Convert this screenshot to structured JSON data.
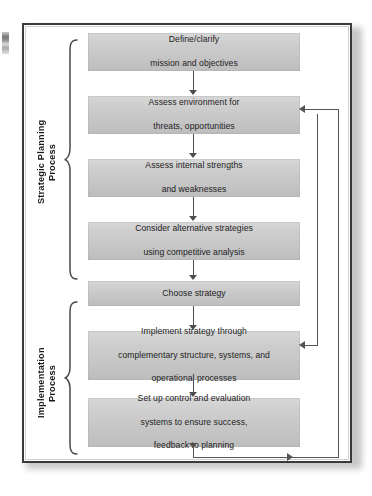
{
  "figure": {
    "type": "process-flow-diagram",
    "title_visible": false,
    "margin_fragment": "",
    "box_fill": "#cdcdcd",
    "frame_color": "#3a3a3a",
    "line_color": "#555555"
  },
  "groups": [
    {
      "id": "strategic-planning",
      "label": "Strategic Planning\nProcess",
      "label_line1": "Strategic Planning",
      "label_line2": "Process",
      "covers_steps": [
        1,
        2,
        3,
        4,
        5
      ]
    },
    {
      "id": "implementation",
      "label": "Implementation\nProcess",
      "label_line1": "Implementation",
      "label_line2": "Process",
      "covers_steps": [
        6,
        7
      ]
    }
  ],
  "steps": [
    {
      "n": 1,
      "id": "define-mission",
      "lines": [
        "Define/clarify",
        "mission and objectives"
      ]
    },
    {
      "n": 2,
      "id": "assess-environment",
      "lines": [
        "Assess environment for",
        "threats, opportunities"
      ]
    },
    {
      "n": 3,
      "id": "assess-internal",
      "lines": [
        "Assess internal strengths",
        "and weaknesses"
      ]
    },
    {
      "n": 4,
      "id": "consider-alternatives",
      "lines": [
        "Consider alternative strategies",
        "using competitive analysis"
      ]
    },
    {
      "n": 5,
      "id": "choose-strategy",
      "lines": [
        "Choose strategy"
      ]
    },
    {
      "n": 6,
      "id": "implement-strategy",
      "lines": [
        "Implement strategy through",
        "complementary structure, systems, and",
        "operational processes"
      ]
    },
    {
      "n": 7,
      "id": "set-up-control",
      "lines": [
        "Set up control and evaluation",
        "systems to ensure success,",
        "feedback to planning"
      ]
    }
  ],
  "connectors": [
    {
      "from": "define-mission",
      "to": "assess-environment",
      "kind": "down-arrow"
    },
    {
      "from": "assess-environment",
      "to": "assess-internal",
      "kind": "down-arrow"
    },
    {
      "from": "assess-internal",
      "to": "consider-alternatives",
      "kind": "down-arrow"
    },
    {
      "from": "consider-alternatives",
      "to": "choose-strategy",
      "kind": "down-arrow"
    },
    {
      "from": "choose-strategy",
      "to": "implement-strategy",
      "kind": "down-arrow"
    },
    {
      "from": "implement-strategy",
      "to": "set-up-control",
      "kind": "down-arrow"
    },
    {
      "from": "set-up-control",
      "to": "feedback-bus",
      "kind": "down-then-right"
    }
  ],
  "feedback": [
    {
      "id": "feedback-to-environment",
      "target": "assess-environment",
      "direction": "left",
      "note": "loops up right side into step 2"
    },
    {
      "id": "feedback-to-implement",
      "target": "implement-strategy",
      "direction": "left",
      "note": "loops up right side into step 6"
    }
  ]
}
